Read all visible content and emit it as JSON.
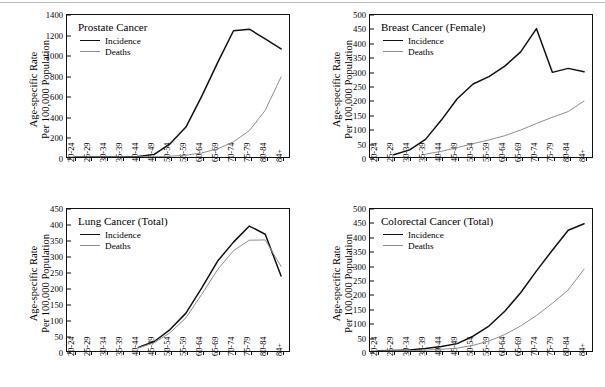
{
  "figure": {
    "axis_title_line1": "Age-specific Rate",
    "axis_title_line2": "Per 100,000 Population",
    "series_labels": {
      "incidence": "Incidence",
      "deaths": "Deaths"
    },
    "colors": {
      "incidence": "#111111",
      "deaths": "#8d8d8d",
      "frame": "#111111",
      "background": "#ffffff"
    },
    "categories": [
      "20-24",
      "25-29",
      "30-34",
      "35-39",
      "40-44",
      "45-49",
      "50-54",
      "55-59",
      "60-64",
      "65-69",
      "70-74",
      "75-79",
      "80-84",
      "84+"
    ]
  },
  "chart_data": [
    {
      "type": "line",
      "panel": "top-left",
      "title": "Prostate Cancer",
      "xlabel": "",
      "ylabel": "Age-specific Rate Per 100,000 Population",
      "ylim": [
        0,
        1400
      ],
      "yticks": [
        0,
        200,
        400,
        600,
        800,
        1000,
        1200,
        1400
      ],
      "grid": false,
      "legend_position": "inside top-left",
      "categories": [
        "20-24",
        "25-29",
        "30-34",
        "35-39",
        "40-44",
        "45-49",
        "50-54",
        "55-59",
        "60-64",
        "65-69",
        "70-74",
        "75-79",
        "80-84",
        "84+"
      ],
      "series": [
        {
          "name": "Incidence",
          "style": "solid",
          "values": [
            0,
            0,
            0,
            1,
            5,
            26,
            130,
            295,
            600,
            930,
            1245,
            1260,
            1165,
            1065
          ]
        },
        {
          "name": "Deaths",
          "style": "thin",
          "values": [
            0,
            0,
            0,
            0,
            1,
            3,
            8,
            18,
            40,
            80,
            150,
            260,
            460,
            790
          ]
        }
      ]
    },
    {
      "type": "line",
      "panel": "top-right",
      "title": "Breast Cancer (Female)",
      "xlabel": "",
      "ylabel": "Age-specific Rate Per 100,000 Population",
      "ylim": [
        0,
        500
      ],
      "yticks": [
        0,
        50,
        100,
        150,
        200,
        250,
        300,
        350,
        400,
        450,
        500
      ],
      "grid": false,
      "legend_position": "inside top-left",
      "categories": [
        "20-24",
        "25-29",
        "30-34",
        "35-39",
        "40-44",
        "45-49",
        "50-54",
        "55-59",
        "60-64",
        "65-69",
        "70-74",
        "75-79",
        "80-84",
        "84+"
      ],
      "series": [
        {
          "name": "Incidence",
          "style": "solid",
          "values": [
            null,
            8,
            25,
            62,
            130,
            205,
            257,
            283,
            320,
            370,
            452,
            298,
            312,
            300
          ]
        },
        {
          "name": "Deaths",
          "style": "thin",
          "values": [
            null,
            null,
            null,
            10,
            20,
            33,
            47,
            60,
            75,
            95,
            118,
            140,
            160,
            197
          ]
        }
      ]
    },
    {
      "type": "line",
      "panel": "bottom-left",
      "title": "Lung Cancer (Total)",
      "xlabel": "",
      "ylabel": "Age-specific Rate Per 100,000 Population",
      "ylim": [
        0,
        450
      ],
      "yticks": [
        0,
        50,
        100,
        150,
        200,
        250,
        300,
        350,
        400,
        450
      ],
      "grid": false,
      "legend_position": "inside top-left",
      "categories": [
        "20-24",
        "25-29",
        "30-34",
        "35-39",
        "40-44",
        "45-49",
        "50-54",
        "55-59",
        "60-64",
        "65-69",
        "70-74",
        "75-79",
        "80-84",
        "84+"
      ],
      "series": [
        {
          "name": "Incidence",
          "style": "solid",
          "values": [
            null,
            null,
            null,
            null,
            11,
            30,
            68,
            120,
            200,
            285,
            345,
            396,
            370,
            238
          ]
        },
        {
          "name": "Deaths",
          "style": "thin",
          "values": [
            null,
            null,
            null,
            null,
            10,
            26,
            58,
            105,
            180,
            258,
            318,
            351,
            352,
            268
          ]
        }
      ]
    },
    {
      "type": "line",
      "panel": "bottom-right",
      "title": "Colorectal Cancer (Total)",
      "xlabel": "",
      "ylabel": "Age-specific Rate Per 100,000 Population",
      "ylim": [
        0,
        500
      ],
      "yticks": [
        0,
        50,
        100,
        150,
        200,
        250,
        300,
        350,
        400,
        450,
        500
      ],
      "grid": false,
      "legend_position": "inside top-left",
      "categories": [
        "20-24",
        "25-29",
        "30-34",
        "35-39",
        "40-44",
        "45-49",
        "50-54",
        "55-59",
        "60-64",
        "65-69",
        "70-74",
        "75-79",
        "80-84",
        "84+"
      ],
      "series": [
        {
          "name": "Incidence",
          "style": "solid",
          "values": [
            1,
            2,
            4,
            9,
            16,
            26,
            52,
            88,
            140,
            205,
            282,
            355,
            425,
            448
          ]
        },
        {
          "name": "Deaths",
          "style": "thin",
          "values": [
            0,
            1,
            1,
            3,
            6,
            10,
            20,
            35,
            58,
            88,
            125,
            168,
            215,
            288
          ]
        }
      ]
    }
  ]
}
